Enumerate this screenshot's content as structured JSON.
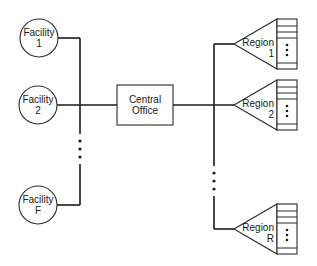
{
  "diagram": {
    "facilities": [
      {
        "name": "Facility",
        "index": "1"
      },
      {
        "name": "Facility",
        "index": "2"
      },
      {
        "name": "Facility",
        "index": "F"
      }
    ],
    "central_office": {
      "line1": "Central",
      "line2": "Office"
    },
    "regions": [
      {
        "name": "Region",
        "index": "1"
      },
      {
        "name": "Region",
        "index": "2"
      },
      {
        "name": "Region",
        "index": "R"
      }
    ],
    "ellipsis": "⋮",
    "colors": {
      "stroke": "#1a1a1a",
      "background": "#ffffff"
    }
  }
}
